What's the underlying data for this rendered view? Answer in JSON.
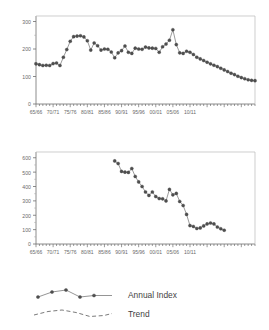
{
  "legend": {
    "entries": [
      {
        "label": "Annual Index",
        "style": "solid-marker",
        "color": "#5a5a5a"
      },
      {
        "label": "Trend",
        "style": "dashed",
        "color": "#6b6b6b"
      }
    ]
  },
  "chart_data": [
    {
      "type": "line",
      "id": "annual-index-top",
      "title": "",
      "xlabel": "",
      "ylabel": "",
      "ylim": [
        0,
        320
      ],
      "yticks": [
        0,
        100,
        200,
        300
      ],
      "ytick_labels": [
        "0",
        "100",
        "200",
        "300"
      ],
      "grid": false,
      "legend_position": "below-figure",
      "categories": [
        "65/66",
        "66/67",
        "67/68",
        "68/69",
        "69/70",
        "70/71",
        "71/72",
        "72/73",
        "73/74",
        "74/75",
        "75/76",
        "76/77",
        "77/78",
        "78/79",
        "79/80",
        "80/81",
        "81/82",
        "82/83",
        "83/84",
        "84/85",
        "85/86",
        "86/87",
        "87/88",
        "88/89",
        "89/90",
        "90/91",
        "91/92",
        "92/93",
        "93/94",
        "94/95",
        "95/96",
        "96/97",
        "97/98",
        "98/99",
        "99/00",
        "00/01",
        "01/02",
        "02/03",
        "03/04",
        "04/05",
        "05/06",
        "06/07",
        "07/08",
        "08/09",
        "09/10",
        "10/11"
      ],
      "xtick_labels": [
        "65/66",
        "70/71",
        "75/76",
        "80/81",
        "85/86",
        "90/91",
        "95/96",
        "00/01",
        "05/06",
        "10/11"
      ],
      "series": [
        {
          "name": "Annual Index",
          "values": [
            146,
            143,
            140,
            141,
            140,
            147,
            149,
            140,
            170,
            198,
            228,
            245,
            247,
            248,
            244,
            230,
            196,
            222,
            212,
            196,
            200,
            199,
            189,
            168,
            186,
            194,
            211,
            188,
            184,
            203,
            200,
            199,
            207,
            204,
            203,
            202,
            188,
            208,
            218,
            232,
            270,
            216,
            186,
            184,
            192,
            188
          ]
        },
        {
          "name": "Trend",
          "values": [
            null,
            null,
            null,
            null,
            null,
            null,
            null,
            null,
            null,
            null,
            null,
            null,
            null,
            null,
            null,
            null,
            null,
            null,
            null,
            null,
            null,
            null,
            null,
            null,
            null,
            null,
            null,
            null,
            null,
            null,
            null,
            null,
            null,
            null,
            null,
            null,
            null,
            null,
            null,
            null,
            null,
            null,
            null,
            null,
            null,
            null
          ]
        }
      ],
      "tail_values": [
        188,
        180,
        170,
        164,
        158,
        152,
        146,
        141,
        136,
        130,
        124,
        118,
        112,
        107,
        101,
        96,
        92,
        88,
        86,
        85
      ]
    },
    {
      "type": "line",
      "id": "annual-index-bottom",
      "title": "",
      "xlabel": "",
      "ylabel": "",
      "ylim": [
        0,
        640
      ],
      "yticks": [
        0,
        100,
        200,
        300,
        400,
        500,
        600
      ],
      "ytick_labels": [
        "0",
        "100",
        "200",
        "300",
        "400",
        "500",
        "600"
      ],
      "grid": false,
      "legend_position": "below-figure",
      "categories": [
        "65/66",
        "70/71",
        "75/76",
        "80/81",
        "85/86",
        "90/91",
        "95/96",
        "00/01",
        "05/06",
        "10/11"
      ],
      "xtick_labels": [
        "65/66",
        "70/71",
        "75/76",
        "80/81",
        "85/86",
        "90/91",
        "95/96",
        "00/01",
        "05/06",
        "10/11"
      ],
      "series": [
        {
          "name": "Annual Index",
          "x_start_year": "88/89",
          "values": [
            578,
            560,
            505,
            500,
            498,
            525,
            470,
            432,
            400,
            362,
            338,
            362,
            330,
            316,
            314,
            300,
            380,
            342,
            352,
            296,
            268,
            206,
            128,
            122,
            108,
            112,
            126,
            140,
            146,
            140,
            118,
            106,
            96
          ]
        }
      ]
    }
  ]
}
